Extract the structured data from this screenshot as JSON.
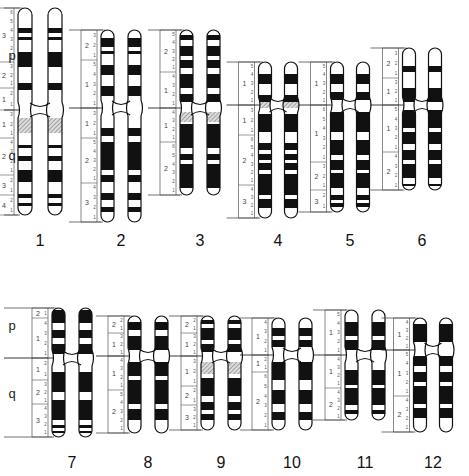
{
  "figure": {
    "arm_labels": {
      "p": "p",
      "q": "q"
    },
    "colors": {
      "band_dark": "#111111",
      "band_light": "#ffffff",
      "outline": "#111111",
      "ruler": "#555555",
      "hatched": "#999999"
    }
  },
  "chromosomes": [
    {
      "id": "1",
      "label": "1",
      "x": 40,
      "top": 8,
      "cen": 110,
      "bottom": 215,
      "width": 14,
      "gap": 16,
      "show_arms": true,
      "arm_p_y": 60,
      "arm_q_y": 160,
      "p_regions": [
        {
          "n": "3",
          "y0": 8,
          "y1": 62
        },
        {
          "n": "2",
          "y0": 62,
          "y1": 88
        },
        {
          "n": "1",
          "y0": 88,
          "y1": 110
        }
      ],
      "q_regions": [
        {
          "n": "1",
          "y0": 110,
          "y1": 138
        },
        {
          "n": "2",
          "y0": 138,
          "y1": 175
        },
        {
          "n": "3",
          "y0": 175,
          "y1": 195
        },
        {
          "n": "4",
          "y0": 195,
          "y1": 215
        }
      ],
      "dark": [
        [
          28,
          33
        ],
        [
          37,
          40
        ],
        [
          52,
          67
        ],
        [
          83,
          90
        ],
        [
          145,
          148
        ],
        [
          156,
          161
        ],
        [
          170,
          182
        ],
        [
          194,
          198
        ],
        [
          203,
          206
        ]
      ],
      "hatch": [
        [
          118,
          133
        ]
      ]
    },
    {
      "id": "2",
      "label": "2",
      "x": 121,
      "top": 30,
      "cen": 108,
      "bottom": 222,
      "width": 13,
      "gap": 14,
      "show_arms": false,
      "p_regions": [
        {
          "n": "2",
          "y0": 30,
          "y1": 60
        },
        {
          "n": "1",
          "y0": 60,
          "y1": 108
        }
      ],
      "q_regions": [
        {
          "n": "1",
          "y0": 108,
          "y1": 138
        },
        {
          "n": "2",
          "y0": 138,
          "y1": 183
        },
        {
          "n": "3",
          "y0": 183,
          "y1": 222
        }
      ],
      "dark": [
        [
          38,
          47
        ],
        [
          51,
          54
        ],
        [
          65,
          75
        ],
        [
          86,
          96
        ],
        [
          128,
          136
        ],
        [
          142,
          170
        ],
        [
          175,
          182
        ],
        [
          193,
          200
        ],
        [
          207,
          212
        ]
      ],
      "hatch": []
    },
    {
      "id": "3",
      "label": "3",
      "x": 200,
      "top": 30,
      "cen": 108,
      "bottom": 195,
      "width": 13,
      "gap": 14,
      "show_arms": false,
      "p_regions": [
        {
          "n": "2",
          "y0": 30,
          "y1": 72
        },
        {
          "n": "1",
          "y0": 72,
          "y1": 108
        }
      ],
      "q_regions": [
        {
          "n": "1",
          "y0": 108,
          "y1": 142
        },
        {
          "n": "2",
          "y0": 142,
          "y1": 195
        }
      ],
      "dark": [
        [
          35,
          40
        ],
        [
          46,
          56
        ],
        [
          60,
          68
        ],
        [
          74,
          88
        ],
        [
          94,
          102
        ],
        [
          124,
          148
        ],
        [
          154,
          160
        ],
        [
          164,
          188
        ]
      ],
      "hatch": [
        [
          112,
          122
        ]
      ]
    },
    {
      "id": "4",
      "label": "4",
      "x": 278,
      "top": 62,
      "cen": 105,
      "bottom": 218,
      "width": 13,
      "gap": 13,
      "show_arms": false,
      "p_regions": [
        {
          "n": "1",
          "y0": 62,
          "y1": 105
        }
      ],
      "q_regions": [
        {
          "n": "1",
          "y0": 105,
          "y1": 135
        },
        {
          "n": "2",
          "y0": 135,
          "y1": 185
        },
        {
          "n": "3",
          "y0": 185,
          "y1": 218
        }
      ],
      "dark": [
        [
          74,
          84
        ],
        [
          95,
          103
        ],
        [
          114,
          132
        ],
        [
          143,
          150
        ],
        [
          154,
          160
        ],
        [
          163,
          170
        ],
        [
          174,
          195
        ],
        [
          199,
          208
        ]
      ],
      "hatch": [
        [
          102,
          108
        ]
      ]
    },
    {
      "id": "5",
      "label": "5",
      "x": 350,
      "top": 62,
      "cen": 105,
      "bottom": 212,
      "width": 13,
      "gap": 13,
      "show_arms": false,
      "p_regions": [
        {
          "n": "1",
          "y0": 62,
          "y1": 105
        }
      ],
      "q_regions": [
        {
          "n": "1",
          "y0": 105,
          "y1": 162
        },
        {
          "n": "2",
          "y0": 162,
          "y1": 190
        },
        {
          "n": "3",
          "y0": 190,
          "y1": 212
        }
      ],
      "dark": [
        [
          74,
          84
        ],
        [
          92,
          100
        ],
        [
          112,
          132
        ],
        [
          140,
          155
        ],
        [
          160,
          170
        ],
        [
          173,
          188
        ],
        [
          195,
          200
        ],
        [
          203,
          207
        ]
      ],
      "hatch": []
    },
    {
      "id": "6",
      "label": "6",
      "x": 422,
      "top": 48,
      "cen": 105,
      "bottom": 190,
      "width": 13,
      "gap": 13,
      "show_arms": false,
      "p_regions": [
        {
          "n": "2",
          "y0": 48,
          "y1": 78
        },
        {
          "n": "1",
          "y0": 78,
          "y1": 105
        }
      ],
      "q_regions": [
        {
          "n": "1",
          "y0": 105,
          "y1": 152
        },
        {
          "n": "2",
          "y0": 152,
          "y1": 190
        }
      ],
      "dark": [
        [
          66,
          72
        ],
        [
          88,
          102
        ],
        [
          110,
          128
        ],
        [
          132,
          144
        ],
        [
          150,
          160
        ],
        [
          164,
          178
        ],
        [
          184,
          186
        ]
      ],
      "hatch": []
    },
    {
      "id": "7",
      "label": "7",
      "x": 72,
      "top": 308,
      "cen": 358,
      "bottom": 437,
      "width": 13,
      "gap": 14,
      "show_arms": true,
      "arm_p_y": 330,
      "arm_q_y": 398,
      "p_regions": [
        {
          "n": "2",
          "y0": 308,
          "y1": 318
        },
        {
          "n": "1",
          "y0": 318,
          "y1": 358
        }
      ],
      "q_regions": [
        {
          "n": "1",
          "y0": 358,
          "y1": 380
        },
        {
          "n": "2",
          "y0": 380,
          "y1": 404
        },
        {
          "n": "3",
          "y0": 404,
          "y1": 437
        }
      ],
      "dark": [
        [
          310,
          323
        ],
        [
          330,
          338
        ],
        [
          344,
          354
        ],
        [
          372,
          392
        ],
        [
          400,
          420
        ],
        [
          425,
          428
        ],
        [
          431,
          433
        ]
      ],
      "hatch": []
    },
    {
      "id": "8",
      "label": "8",
      "x": 148,
      "top": 316,
      "cen": 356,
      "bottom": 433,
      "width": 13,
      "gap": 14,
      "show_arms": false,
      "p_regions": [
        {
          "n": "2",
          "y0": 316,
          "y1": 333
        },
        {
          "n": "1",
          "y0": 333,
          "y1": 356
        }
      ],
      "q_regions": [
        {
          "n": "1",
          "y0": 356,
          "y1": 390
        },
        {
          "n": "2",
          "y0": 390,
          "y1": 433
        }
      ],
      "dark": [
        [
          322,
          330
        ],
        [
          336,
          350
        ],
        [
          362,
          376
        ],
        [
          380,
          404
        ],
        [
          409,
          420
        ]
      ],
      "hatch": []
    },
    {
      "id": "9",
      "label": "9",
      "x": 221,
      "top": 316,
      "cen": 356,
      "bottom": 430,
      "width": 13,
      "gap": 14,
      "show_arms": false,
      "p_regions": [
        {
          "n": "2",
          "y0": 316,
          "y1": 333
        },
        {
          "n": "1",
          "y0": 333,
          "y1": 356
        }
      ],
      "q_regions": [
        {
          "n": "1",
          "y0": 356,
          "y1": 386
        },
        {
          "n": "2",
          "y0": 386,
          "y1": 405
        },
        {
          "n": "3",
          "y0": 405,
          "y1": 430
        }
      ],
      "dark": [
        [
          320,
          324
        ],
        [
          328,
          340
        ],
        [
          344,
          352
        ],
        [
          378,
          396
        ],
        [
          402,
          410
        ],
        [
          414,
          420
        ]
      ],
      "hatch": [
        [
          362,
          374
        ]
      ]
    },
    {
      "id": "10",
      "label": "10",
      "x": 292,
      "top": 318,
      "cen": 355,
      "bottom": 430,
      "width": 13,
      "gap": 14,
      "show_arms": false,
      "p_regions": [
        {
          "n": "1",
          "y0": 318,
          "y1": 355
        }
      ],
      "q_regions": [
        {
          "n": "1",
          "y0": 355,
          "y1": 372
        },
        {
          "n": "2",
          "y0": 372,
          "y1": 430
        }
      ],
      "dark": [
        [
          328,
          336
        ],
        [
          340,
          347
        ],
        [
          362,
          380
        ],
        [
          390,
          404
        ],
        [
          412,
          420
        ]
      ],
      "hatch": []
    },
    {
      "id": "11",
      "label": "11",
      "x": 365,
      "top": 310,
      "cen": 355,
      "bottom": 420,
      "width": 13,
      "gap": 14,
      "show_arms": false,
      "p_regions": [
        {
          "n": "1",
          "y0": 310,
          "y1": 355
        }
      ],
      "q_regions": [
        {
          "n": "1",
          "y0": 355,
          "y1": 388
        },
        {
          "n": "2",
          "y0": 388,
          "y1": 420
        }
      ],
      "dark": [
        [
          322,
          336
        ],
        [
          340,
          350
        ],
        [
          370,
          385
        ],
        [
          388,
          405
        ],
        [
          410,
          414
        ]
      ],
      "hatch": []
    },
    {
      "id": "12",
      "label": "12",
      "x": 433,
      "top": 318,
      "cen": 350,
      "bottom": 432,
      "width": 13,
      "gap": 13,
      "show_arms": false,
      "p_regions": [
        {
          "n": "1",
          "y0": 318,
          "y1": 350
        }
      ],
      "q_regions": [
        {
          "n": "1",
          "y0": 350,
          "y1": 396
        },
        {
          "n": "2",
          "y0": 396,
          "y1": 432
        }
      ],
      "dark": [
        [
          324,
          342
        ],
        [
          356,
          366
        ],
        [
          372,
          382
        ],
        [
          386,
          404
        ],
        [
          408,
          418
        ]
      ],
      "hatch": []
    }
  ]
}
